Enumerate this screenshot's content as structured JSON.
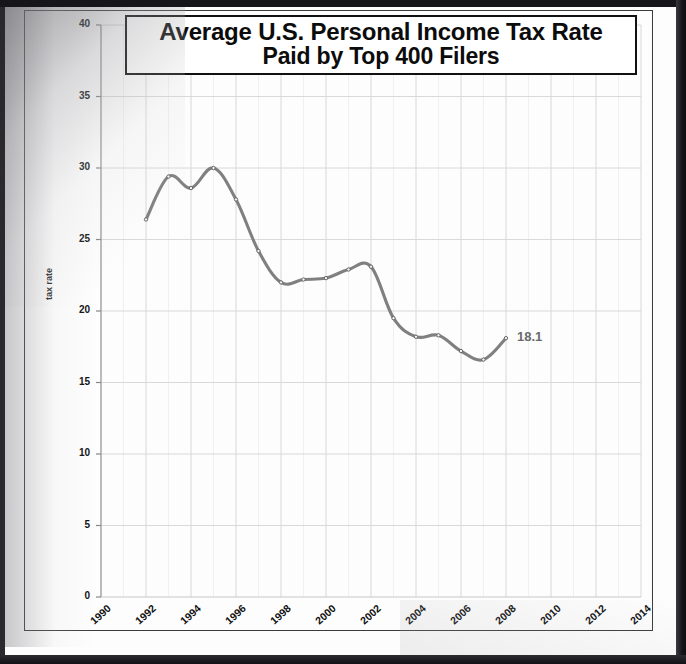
{
  "document": {
    "kind": "scanned-chart-page"
  },
  "chart_data": {
    "type": "line",
    "title": "Average U.S. Personal Income Tax Rate Paid by Top 400 Filers",
    "title_lines": [
      "Average U.S. Personal Income Tax Rate",
      "Paid by Top 400 Filers"
    ],
    "xlabel": "",
    "ylabel": "tax rate",
    "xlim": [
      1990,
      2014
    ],
    "ylim": [
      0,
      40
    ],
    "xticks": [
      1990,
      1992,
      1994,
      1996,
      1998,
      2000,
      2002,
      2004,
      2006,
      2008,
      2010,
      2012,
      2014
    ],
    "yticks": [
      0,
      5,
      10,
      15,
      20,
      25,
      30,
      35,
      40
    ],
    "xtick_labels": [
      "1990",
      "1992",
      "1994",
      "1996",
      "1998",
      "2000",
      "2002",
      "2004",
      "2006",
      "2008",
      "2010",
      "2012",
      "2014"
    ],
    "ytick_labels": [
      "0",
      "5",
      "10",
      "15",
      "20",
      "25",
      "30",
      "35",
      "40"
    ],
    "grid": true,
    "legend": false,
    "smoothed": true,
    "markers": true,
    "line_color": "#808080",
    "grid_color": "#d8d8d8",
    "x": [
      1992,
      1993,
      1994,
      1995,
      1996,
      1997,
      1998,
      1999,
      2000,
      2001,
      2002,
      2003,
      2004,
      2005,
      2006,
      2007,
      2008
    ],
    "values": [
      26.4,
      29.4,
      28.6,
      30.0,
      27.8,
      24.2,
      22.0,
      22.2,
      22.3,
      22.9,
      23.1,
      19.5,
      18.2,
      18.3,
      17.2,
      16.6,
      18.1
    ],
    "annotations": [
      {
        "text": "18.1",
        "x": 2008,
        "y": 18.1
      }
    ]
  }
}
